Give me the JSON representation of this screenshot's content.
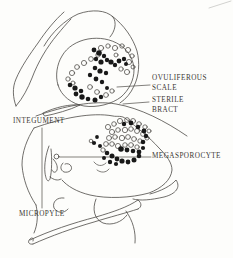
{
  "figure": {
    "background": "#fdfdfb",
    "ink": "#4d4a46",
    "cell_fill": "#191919",
    "label_color": "#3b3733",
    "labels": {
      "ovuliferous_scale": {
        "line1": "OVULIFEROUS",
        "line2": "SCALE"
      },
      "sterile_bract": {
        "line1": "STERILE",
        "line2": "BRACT"
      },
      "integument": {
        "text": "INTEGUMENT"
      },
      "megasporocyte": {
        "text": "MEGASPOROCYTE"
      },
      "micropyle": {
        "text": "MICROPYLE"
      }
    }
  }
}
